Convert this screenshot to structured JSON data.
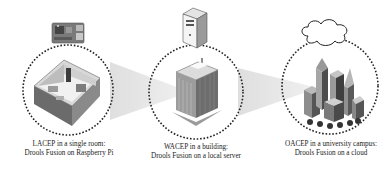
{
  "diagram": {
    "levels": [
      {
        "id": "lacep",
        "caption_line1": "LACEP in a single room:",
        "caption_line2": "Drools Fusion on Raspberry Pi",
        "scope_icon": "room-icon",
        "device_icon": "raspberry-pi-icon"
      },
      {
        "id": "wacep",
        "caption_line1": "WACEP in a building:",
        "caption_line2": "Drools Fusion on a local server",
        "scope_icon": "building-icon",
        "device_icon": "server-icon"
      },
      {
        "id": "oacep",
        "caption_line1": "OACEP in a university campus:",
        "caption_line2": "Drools Fusion on a cloud",
        "scope_icon": "city-campus-icon",
        "device_icon": "cloud-icon"
      }
    ],
    "colors": {
      "circle_border": "#222222",
      "projection": "#e4e4e4",
      "text": "#222222"
    }
  }
}
